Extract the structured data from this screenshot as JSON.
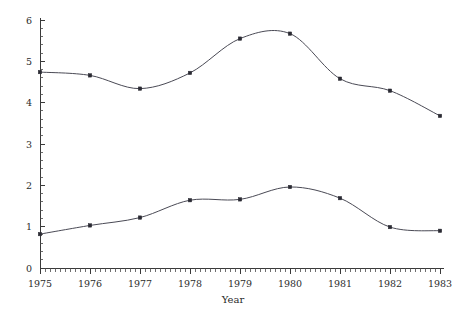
{
  "chart_data": {
    "type": "line",
    "title": "",
    "subtitle": "",
    "xlabel": "Year",
    "ylabel": "",
    "x": [
      1975,
      1976,
      1977,
      1978,
      1979,
      1980,
      1981,
      1982,
      1983
    ],
    "categories": [
      "1975",
      "1976",
      "1977",
      "1978",
      "1979",
      "1980",
      "1981",
      "1982",
      "1983"
    ],
    "xtick_labels": [
      "1975",
      "1976",
      "1977",
      "1978",
      "1979",
      "1980",
      "1981",
      "1982",
      "1983"
    ],
    "ytick_labels": [
      "0",
      "1",
      "2",
      "3",
      "4",
      "5",
      "6"
    ],
    "xlim": [
      1975,
      1983
    ],
    "ylim": [
      0,
      6
    ],
    "grid": false,
    "legend": "none",
    "minor_ticks_per_interval_x": 10,
    "minor_ticks_per_interval_y": 5,
    "smoothing": "spline",
    "marker": "square",
    "series": [
      {
        "name": "upper-series",
        "color": "#4a4a55",
        "values": [
          4.74,
          4.66,
          4.34,
          4.72,
          5.55,
          5.67,
          4.58,
          4.29,
          3.68
        ]
      },
      {
        "name": "lower-series",
        "color": "#4a4a55",
        "values": [
          0.82,
          1.03,
          1.22,
          1.64,
          1.66,
          1.96,
          1.69,
          0.99,
          0.9
        ]
      }
    ]
  },
  "colors": {
    "background": "#ffffff",
    "axis": "#3a3a3a",
    "line": "#4a4a55",
    "marker": "#2a2a33",
    "text": "#2b2b2b"
  }
}
